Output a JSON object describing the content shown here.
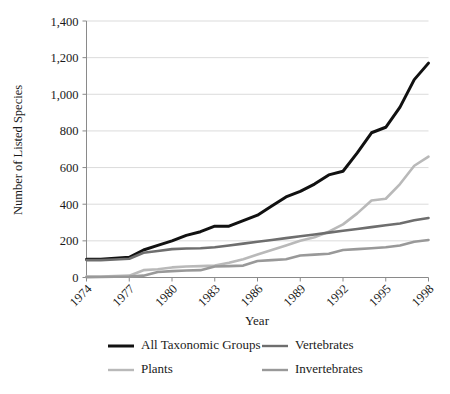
{
  "chart_data": {
    "type": "line",
    "title": "",
    "xlabel": "Year",
    "ylabel": "Number of Listed Species",
    "xlim": [
      1974,
      1998
    ],
    "ylim": [
      0,
      1400
    ],
    "ytick_values": [
      0,
      200,
      400,
      600,
      800,
      1000,
      1200,
      1400
    ],
    "ytick_labels": [
      "0",
      "200",
      "400",
      "600",
      "800",
      "1,000",
      "1,200",
      "1,400"
    ],
    "xtick_values": [
      1974,
      1977,
      1980,
      1983,
      1986,
      1989,
      1992,
      1995,
      1998
    ],
    "xtick_labels": [
      "1974",
      "1977",
      "1980",
      "1983",
      "1986",
      "1989",
      "1992",
      "1995",
      "1998"
    ],
    "grid": "horizontal",
    "legend_position": "bottom",
    "x": [
      1974,
      1975,
      1976,
      1977,
      1978,
      1979,
      1980,
      1981,
      1982,
      1983,
      1984,
      1985,
      1986,
      1987,
      1988,
      1989,
      1990,
      1991,
      1992,
      1993,
      1994,
      1995,
      1996,
      1997,
      1998
    ],
    "series": [
      {
        "name": "All Taxonomic Groups",
        "color": "#111111",
        "width": 3.0,
        "values": [
          100,
          100,
          105,
          110,
          150,
          175,
          200,
          230,
          250,
          280,
          280,
          310,
          340,
          390,
          440,
          470,
          510,
          560,
          580,
          680,
          790,
          820,
          930,
          1080,
          1170
        ]
      },
      {
        "name": "Plants",
        "color": "#b9b9b9",
        "width": 2.6,
        "values": [
          5,
          5,
          8,
          10,
          40,
          45,
          55,
          60,
          62,
          65,
          80,
          100,
          125,
          150,
          175,
          200,
          220,
          250,
          290,
          350,
          420,
          430,
          510,
          610,
          660
        ]
      },
      {
        "name": "Vertebrates",
        "color": "#6e6e6e",
        "width": 2.6,
        "values": [
          95,
          95,
          98,
          102,
          135,
          145,
          155,
          158,
          160,
          165,
          175,
          185,
          195,
          205,
          215,
          225,
          235,
          245,
          255,
          265,
          275,
          285,
          295,
          312,
          325
        ]
      },
      {
        "name": "Invertebrates",
        "color": "#999999",
        "width": 2.6,
        "values": [
          2,
          3,
          4,
          5,
          10,
          30,
          35,
          38,
          40,
          60,
          62,
          65,
          90,
          95,
          100,
          120,
          125,
          130,
          150,
          155,
          160,
          165,
          175,
          195,
          205
        ]
      }
    ]
  },
  "legend": {
    "items": [
      {
        "label": "All Taxonomic Groups",
        "color": "#111111"
      },
      {
        "label": "Vertebrates",
        "color": "#6e6e6e"
      },
      {
        "label": "Plants",
        "color": "#b9b9b9"
      },
      {
        "label": "Invertebrates",
        "color": "#999999"
      }
    ]
  },
  "axes": {
    "x_title": "Year",
    "y_title": "Number of Listed Species"
  }
}
